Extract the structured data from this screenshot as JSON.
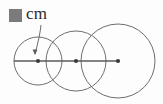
{
  "figure": {
    "kind": "geometry-diagram",
    "background_color": "#fdfdfd",
    "stroke_color": "#6e6e6e",
    "line_color": "#5a5a5a",
    "dot_color": "#3a3a3a",
    "label_color": "#2b2b2b"
  },
  "legend": {
    "swatch_name": "redacted-value-square",
    "swatch_color": "#7b7b7b",
    "unit_label": "cm"
  },
  "leader": {
    "name": "radius-callout-arrow",
    "from_x": 41,
    "from_y": 25,
    "to_x": 35,
    "to_y": 54,
    "arrow_direction": "down"
  },
  "axis_line": {
    "name": "centers-axis",
    "x1": 14,
    "x2": 118,
    "y": 61
  },
  "chart_data": {
    "type": "scatter",
    "title": "",
    "xlabel": "",
    "ylabel": "",
    "grid": false,
    "legend_position": "top-left",
    "circles": [
      {
        "label": "circle-1",
        "cx": 38,
        "cy": 61,
        "r": 24
      },
      {
        "label": "circle-2",
        "cx": 76,
        "cy": 61,
        "r": 30
      },
      {
        "label": "circle-3",
        "cx": 118,
        "cy": 61,
        "r": 37
      }
    ],
    "centers": [
      {
        "label": "center-1",
        "x": 38,
        "y": 61
      },
      {
        "label": "center-2",
        "x": 76,
        "y": 61
      },
      {
        "label": "center-3",
        "x": 118,
        "y": 61
      }
    ]
  }
}
